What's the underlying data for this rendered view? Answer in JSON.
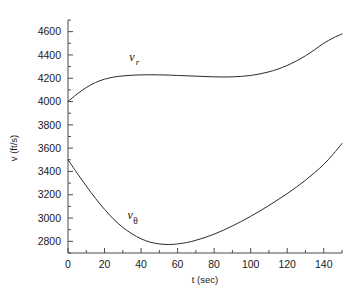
{
  "chart_data": {
    "type": "line",
    "title": "",
    "xlabel": "t (sec)",
    "ylabel": "v (ft/s)",
    "xlim": [
      0,
      150
    ],
    "ylim": [
      2700,
      4700
    ],
    "grid": false,
    "legend": "inline-labels",
    "xticks": [
      0,
      20,
      40,
      60,
      80,
      100,
      120,
      140
    ],
    "xtick_labels": [
      "0",
      "20",
      "40",
      "60",
      "80",
      "100",
      "120",
      "140"
    ],
    "yticks": [
      2800,
      3000,
      3200,
      3400,
      3600,
      3800,
      4000,
      4200,
      4400,
      4600
    ],
    "ytick_labels": [
      "2800",
      "3000",
      "3200",
      "3400",
      "3600",
      "3800",
      "4000",
      "4200",
      "4400",
      "4600"
    ],
    "x": [
      0,
      5,
      10,
      15,
      20,
      25,
      30,
      35,
      40,
      45,
      50,
      55,
      60,
      65,
      70,
      75,
      80,
      85,
      90,
      95,
      100,
      105,
      110,
      115,
      120,
      125,
      130,
      135,
      140,
      145,
      150
    ],
    "series": [
      {
        "name": "v_r",
        "label": "v",
        "sublabel": "r",
        "label_x": 35,
        "label_y": 4350,
        "values": [
          4000,
          4065,
          4120,
          4163,
          4192,
          4210,
          4220,
          4226,
          4229,
          4230,
          4229,
          4227,
          4224,
          4221,
          4218,
          4215,
          4212,
          4211,
          4212,
          4216,
          4224,
          4237,
          4255,
          4279,
          4310,
          4348,
          4393,
          4445,
          4500,
          4545,
          4580
        ]
      },
      {
        "name": "v_theta",
        "label": "v",
        "sublabel": "θ",
        "label_x": 34,
        "label_y": 2990,
        "values": [
          3500,
          3385,
          3275,
          3170,
          3075,
          2990,
          2920,
          2865,
          2822,
          2793,
          2778,
          2773,
          2778,
          2790,
          2809,
          2833,
          2862,
          2895,
          2932,
          2972,
          3015,
          3060,
          3108,
          3158,
          3210,
          3265,
          3325,
          3390,
          3460,
          3545,
          3640
        ]
      }
    ]
  }
}
